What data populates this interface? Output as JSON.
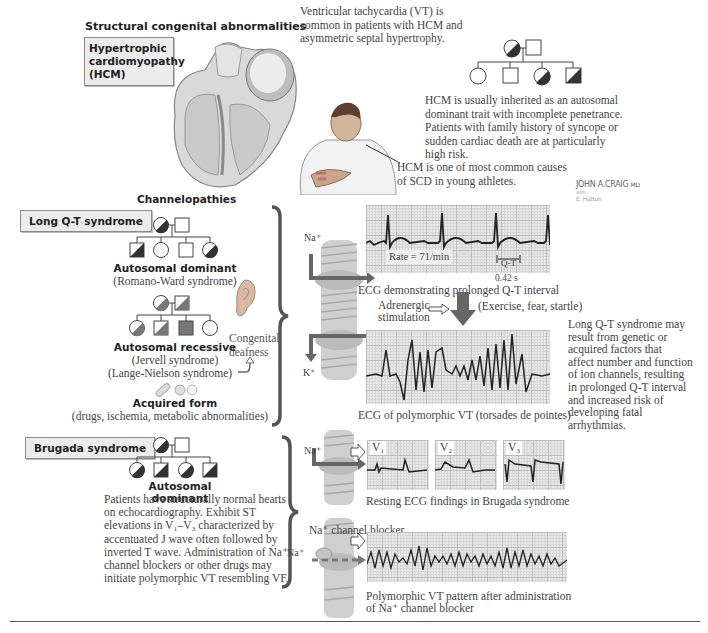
{
  "structural": {
    "heading": "Structural congenital abnormalities",
    "hcm_box": [
      "Hypertrophic",
      "cardiomyopathy",
      "(HCM)"
    ],
    "vt_note": [
      "Ventricular tachycardia (VT) is",
      "common in patients with HCM and",
      "asymmetric septal hypertrophy."
    ],
    "inheritance_note": [
      "HCM is usually inherited as an autosomal",
      "dominant trait with incomplete penetrance.",
      "Patients with family history of syncope or",
      "sudden cardiac death are at particularly",
      "high risk."
    ],
    "athlete_note": [
      "HCM is one of most common causes",
      "of SCD in young athletes."
    ]
  },
  "signature": {
    "name": "JOHN A.CRAIG",
    "suffix": "MD",
    "with": "with",
    "coauthor": "E. Hatton"
  },
  "channelopathies": {
    "heading": "Channelopathies",
    "long_qt": {
      "box": "Long Q-T syndrome",
      "dominant_title": "Autosomal dominant",
      "dominant_sub": "(Romano-Ward syndrome)",
      "recessive_title": "Autosomal recessive",
      "recessive_sub1": "(Jervell syndrome)",
      "recessive_sub2": "(Lange-Nielson syndrome)",
      "deafness": [
        "Congenital",
        "deafness"
      ],
      "acquired_title": "Acquired form",
      "acquired_sub": "(drugs, ischemia, metabolic abnormalities)",
      "ion_na": "Na⁺",
      "ion_k": "K⁺",
      "ecg1": {
        "rate": "Rate = 71/min",
        "qt_label": "Q-T",
        "qt_value": "0.42 s",
        "caption": "ECG demonstrating prolonged Q-T interval"
      },
      "trigger": {
        "label": [
          "Adrenergic",
          "stimulation"
        ],
        "examples": "(Exercise, fear, startle)"
      },
      "ecg2": {
        "caption": "ECG of polymorphic VT (torsades de pointes)"
      },
      "summary": [
        "Long Q-T syndrome may",
        "result from genetic or",
        "acquired factors that",
        "affect number and function",
        "of ion channels, resulting",
        "in prolonged Q-T interval",
        "and increased risk of",
        "developing fatal",
        "arrhythmias."
      ]
    },
    "brugada": {
      "box": "Brugada syndrome",
      "title": "Autosomal dominant",
      "description": [
        "Patients have structurally normal hearts",
        "on echocardiography. Exhibit ST",
        "elevations in V₁–V₃ characterized by",
        "accentuated J wave often followed by",
        "inverted T wave. Administration of Na⁺",
        "channel blockers or other drugs may",
        "initiate polymorphic VT resembling VF."
      ],
      "ion_na": "Na⁺",
      "leads": [
        "V₁",
        "V₂",
        "V₃"
      ],
      "resting_caption": "Resting ECG findings in Brugada syndrome",
      "blocker_label": "Na⁺ channel blocker",
      "ion_na2": "Na⁺",
      "vt_caption": [
        "Polymorphic VT pattern after administration",
        "of Na⁺ channel blocker"
      ]
    }
  },
  "colors": {
    "box_bg": "#ececec",
    "box_border": "#8a8a8a",
    "brace": "#555555",
    "ecg_bg": "#e9e9e9",
    "arrow": "#666666"
  }
}
